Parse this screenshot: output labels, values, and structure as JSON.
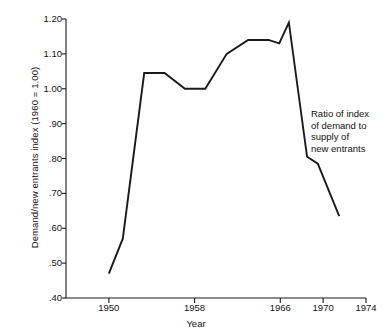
{
  "chart_data": {
    "type": "line",
    "title": "",
    "xlabel": "Year",
    "ylabel": "Demand/new entrants index (1960 = 1.00)",
    "xlim": [
      1946,
      1974
    ],
    "ylim": [
      0.4,
      1.2
    ],
    "grid": false,
    "legend": null,
    "annotations": [
      "Ratio of index",
      "of demand to",
      "supply of",
      "new entrants"
    ],
    "xticks": [
      1950,
      1958,
      1966,
      1970,
      1974
    ],
    "xticklabels": [
      "1950",
      "1958",
      "1966",
      "1970",
      "1974"
    ],
    "yticks": [
      0.4,
      0.5,
      0.6,
      0.7,
      0.8,
      0.9,
      1.0,
      1.1,
      1.2
    ],
    "yticklabels": [
      ".40",
      ".50",
      ".60",
      ".70",
      ".80",
      ".90",
      "1.00",
      "1.10",
      "1.20"
    ],
    "series": [
      {
        "name": "Ratio of index of demand to supply of new entrants",
        "color": "#1a1a1a",
        "x": [
          1950,
          1951.3,
          1953.3,
          1955.2,
          1957.1,
          1959.0,
          1961.0,
          1963.0,
          1964.9,
          1965.9,
          1966.8,
          1968.5,
          1969.5,
          1971.5
        ],
        "y": [
          0.47,
          0.57,
          1.045,
          1.045,
          1.0,
          1.0,
          1.1,
          1.14,
          1.14,
          1.13,
          1.19,
          0.805,
          0.785,
          0.635
        ]
      }
    ]
  },
  "axis": {
    "y_title": "Demand/new entrants index (1960 = 1.00)",
    "x_title": "Year"
  },
  "annotation": {
    "line1": "Ratio of index",
    "line2": "of demand to",
    "line3": "supply of",
    "line4": "new entrants"
  }
}
